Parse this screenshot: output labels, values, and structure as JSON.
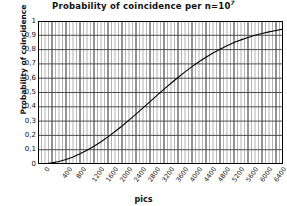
{
  "chart_data": {
    "type": "line",
    "title": "Probability of coincidence per n=10",
    "title_superscript": "7",
    "title_full": "Probability of coincidence per n=10^7",
    "xlabel": "pics",
    "ylabel": "Probability of coincidence",
    "xlim": [
      0,
      7000
    ],
    "ylim": [
      0,
      1
    ],
    "grid": true,
    "legend": false,
    "legend_position": "none",
    "decimal_separator": ",",
    "x_ticks": [
      0,
      400,
      800,
      1200,
      1600,
      2000,
      2400,
      2800,
      3200,
      3600,
      4000,
      4400,
      4800,
      5200,
      5600,
      6000,
      6400,
      6800
    ],
    "x_tick_labels": [
      "0",
      "400",
      "800",
      "1200",
      "1600",
      "2000",
      "2400",
      "2800",
      "3200",
      "3600",
      "4000",
      "4400",
      "4800",
      "5200",
      "5600",
      "6000",
      "6400",
      "6800"
    ],
    "y_ticks": [
      0,
      0.1,
      0.2,
      0.3,
      0.4,
      0.5,
      0.6,
      0.7,
      0.8,
      0.9,
      1
    ],
    "y_tick_labels": [
      "0",
      "0,1",
      "0,2",
      "0,3",
      "0,4",
      "0,5",
      "0,6",
      "0,7",
      "0,8",
      "0,9",
      "1"
    ],
    "x_minor_tick_step": 100,
    "series": [
      {
        "name": "Probability of coincidence",
        "color": "#000000",
        "x": [
          0,
          200,
          400,
          600,
          800,
          1000,
          1200,
          1400,
          1600,
          1800,
          2000,
          2200,
          2400,
          2600,
          2800,
          3000,
          3200,
          3400,
          3600,
          3800,
          4000,
          4200,
          4400,
          4600,
          4800,
          5000,
          5200,
          5400,
          5600,
          5800,
          6000,
          6200,
          6400,
          6600,
          6800,
          7000
        ],
        "values": [
          0.0,
          0.002,
          0.008,
          0.018,
          0.032,
          0.049,
          0.071,
          0.096,
          0.124,
          0.156,
          0.19,
          0.227,
          0.266,
          0.307,
          0.349,
          0.392,
          0.436,
          0.48,
          0.523,
          0.565,
          0.605,
          0.644,
          0.681,
          0.715,
          0.747,
          0.776,
          0.803,
          0.827,
          0.849,
          0.868,
          0.885,
          0.9,
          0.913,
          0.924,
          0.934,
          0.943
        ]
      }
    ]
  },
  "style": {
    "plot_background": "#ffffff",
    "frame_color": "#000000",
    "major_grid_color": "#4d4d4d",
    "minor_grid_color": "#b3b3b3",
    "curve_color": "#000000"
  }
}
